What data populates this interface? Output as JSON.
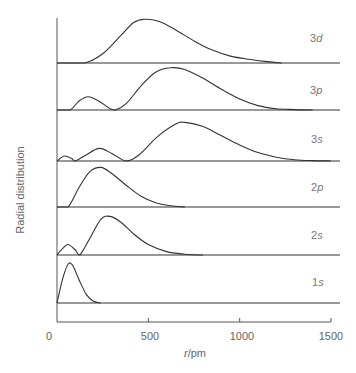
{
  "chart_data": {
    "type": "line",
    "title": "",
    "xlabel": "r/pm",
    "ylabel": "Radial distribution",
    "xlim": [
      0,
      1500
    ],
    "xticks": [
      0,
      500,
      1000,
      1500
    ],
    "xtick_labels": [
      "0",
      "500",
      "1000",
      "1500"
    ],
    "grid": false,
    "legend": "inline labels at right of each panel",
    "layout": "stacked panels, one per orbital, sharing x-axis",
    "series": [
      {
        "name": "3d",
        "label_main": "3",
        "label_italic": "d",
        "nodes_pm": [],
        "x": [
          0,
          150,
          250,
          350,
          420,
          480,
          560,
          650,
          750,
          850,
          950,
          1050,
          1150,
          1230
        ],
        "values": [
          0,
          0.0,
          0.2,
          0.6,
          0.88,
          0.95,
          0.9,
          0.72,
          0.48,
          0.28,
          0.15,
          0.08,
          0.03,
          0
        ]
      },
      {
        "name": "3p",
        "label_main": "3",
        "label_italic": "p",
        "nodes_pm": [
          320
        ],
        "x": [
          0,
          70,
          120,
          170,
          230,
          290,
          320,
          380,
          460,
          540,
          620,
          700,
          800,
          900,
          1000,
          1100,
          1200,
          1300,
          1400
        ],
        "values": [
          0,
          0.0,
          0.2,
          0.3,
          0.2,
          0.03,
          0,
          0.15,
          0.55,
          0.86,
          0.96,
          0.92,
          0.72,
          0.47,
          0.25,
          0.1,
          0.03,
          0.01,
          0
        ]
      },
      {
        "name": "3s",
        "label_main": "3",
        "label_italic": "s",
        "nodes_pm": [
          100,
          380
        ],
        "x": [
          0,
          40,
          80,
          100,
          150,
          230,
          300,
          380,
          450,
          550,
          650,
          700,
          800,
          900,
          1000,
          1100,
          1200,
          1300,
          1400,
          1500
        ],
        "values": [
          0,
          0.12,
          0.06,
          0,
          0.12,
          0.3,
          0.18,
          0,
          0.15,
          0.58,
          0.88,
          0.92,
          0.82,
          0.6,
          0.38,
          0.2,
          0.09,
          0.03,
          0.01,
          0
        ]
      },
      {
        "name": "2p",
        "label_main": "2",
        "label_italic": "p",
        "nodes_pm": [],
        "x": [
          0,
          60,
          120,
          180,
          240,
          300,
          380,
          460,
          540,
          620,
          700
        ],
        "values": [
          0,
          0.0,
          0.45,
          0.82,
          0.92,
          0.78,
          0.5,
          0.25,
          0.1,
          0.03,
          0
        ]
      },
      {
        "name": "2s",
        "label_main": "2",
        "label_italic": "s",
        "nodes_pm": [
          125
        ],
        "x": [
          0,
          30,
          60,
          100,
          125,
          180,
          240,
          290,
          350,
          420,
          500,
          600,
          700,
          800
        ],
        "values": [
          0,
          0.15,
          0.25,
          0.12,
          0,
          0.4,
          0.85,
          0.92,
          0.78,
          0.5,
          0.25,
          0.08,
          0.02,
          0
        ]
      },
      {
        "name": "1s",
        "label_main": "1",
        "label_italic": "s",
        "nodes_pm": [],
        "x": [
          0,
          30,
          60,
          85,
          120,
          160,
          200,
          240
        ],
        "values": [
          0,
          0.55,
          0.9,
          0.88,
          0.55,
          0.2,
          0.04,
          0
        ]
      }
    ]
  },
  "axis": {
    "xlabel": "r/pm",
    "ylabel": "Radial distribution",
    "tick_labels": [
      "0",
      "500",
      "1000",
      "1500"
    ]
  },
  "labels": {
    "3d": {
      "n": "3",
      "l": "d"
    },
    "3p": {
      "n": "3",
      "l": "p"
    },
    "3s": {
      "n": "3",
      "l": "s"
    },
    "2p": {
      "n": "2",
      "l": "p"
    },
    "2s": {
      "n": "2",
      "l": "s"
    },
    "1s": {
      "n": "1",
      "l": "s"
    }
  }
}
